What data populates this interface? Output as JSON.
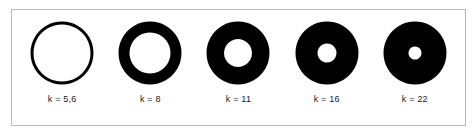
{
  "figure": {
    "background_color": "#ffffff",
    "frame_color": "#b9b9b9",
    "ring_color": "#000000",
    "hole_color": "#ffffff",
    "label_color": "#1a1a1a"
  },
  "chart_data": {
    "type": "diagram",
    "title": "",
    "subtitle": "",
    "xlabel": "",
    "ylabel": "",
    "legend": [],
    "grid": false,
    "categories": [
      "k = 5,6",
      "k = 8",
      "k = 11",
      "k = 16",
      "k = 22"
    ],
    "series": [
      {
        "name": "k value",
        "values": [
          5.6,
          8,
          11,
          16,
          22
        ]
      },
      {
        "name": "outer diameter (px)",
        "values": [
          63,
          63,
          63,
          63,
          63
        ]
      },
      {
        "name": "inner hole diameter (px)",
        "values": [
          57,
          41,
          28,
          19,
          13
        ]
      }
    ]
  },
  "rings": [
    {
      "id": "ring-1",
      "label": "k = 5,6",
      "k_value": "5,6",
      "outer_diameter": 63,
      "inner_diameter": 57
    },
    {
      "id": "ring-2",
      "label": "k = 8",
      "k_value": "8",
      "outer_diameter": 63,
      "inner_diameter": 41
    },
    {
      "id": "ring-3",
      "label": "k = 11",
      "k_value": "11",
      "outer_diameter": 63,
      "inner_diameter": 28
    },
    {
      "id": "ring-4",
      "label": "k = 16",
      "k_value": "16",
      "outer_diameter": 63,
      "inner_diameter": 19
    },
    {
      "id": "ring-5",
      "label": "k = 22",
      "k_value": "22",
      "outer_diameter": 63,
      "inner_diameter": 13
    }
  ]
}
